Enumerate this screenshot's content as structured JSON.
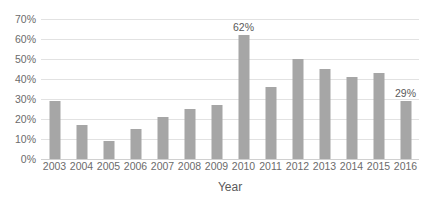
{
  "chart_data": {
    "type": "bar",
    "title": "",
    "subtitle": "",
    "xlabel": "Year",
    "ylabel": "",
    "categories": [
      "2003",
      "2004",
      "2005",
      "2006",
      "2007",
      "2008",
      "2009",
      "2010",
      "2011",
      "2012",
      "2013",
      "2014",
      "2015",
      "2016"
    ],
    "values": [
      29,
      17,
      9,
      15,
      21,
      25,
      27,
      62,
      36,
      50,
      45,
      41,
      43,
      29
    ],
    "ylim": [
      0,
      70
    ],
    "ytick_values": [
      0,
      10,
      20,
      30,
      40,
      50,
      60,
      70
    ],
    "ytick_labels": [
      "0%",
      "10%",
      "20%",
      "30%",
      "40%",
      "50%",
      "60%",
      "70%"
    ],
    "xtick_labels": [
      "2003",
      "2004",
      "2005",
      "2006",
      "2007",
      "2008",
      "2009",
      "2010",
      "2011",
      "2012",
      "2013",
      "2014",
      "2015",
      "2016"
    ],
    "data_labels": [
      {
        "category": "2010",
        "text": "62%"
      },
      {
        "category": "2016",
        "text": "29%"
      }
    ],
    "grid": true,
    "grid_axis": "y",
    "legend": false,
    "legend_position": "none",
    "series_color": "#a6a6a6",
    "gridline_color": "#e2e2e2",
    "axis_text_color": "#6b6b6b",
    "background_color": "#ffffff"
  }
}
